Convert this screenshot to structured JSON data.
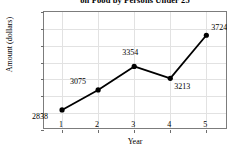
{
  "chart_data": {
    "type": "line",
    "title": "on Food by Persons Under 25",
    "xlabel": "Year",
    "ylabel": "Amount (dollars)",
    "x": [
      1,
      2,
      3,
      4,
      5
    ],
    "categories": [
      "1",
      "2",
      "3",
      "4",
      "5"
    ],
    "series": [
      {
        "name": "Amount Spent on Food",
        "values": [
          2838,
          3075,
          3354,
          3213,
          3724
        ]
      }
    ],
    "point_labels": [
      "2838",
      "3075",
      "3354",
      "3213",
      "3724"
    ],
    "ylim": [
      2600,
      4000
    ],
    "yticks": [
      2600,
      2800,
      3000,
      3200,
      3400,
      3600,
      3800,
      4000
    ],
    "ytick_labels": [
      "2600",
      "2800",
      "3000",
      "3200",
      "3400",
      "3600",
      "3800",
      "4000"
    ],
    "xlim": [
      0.5,
      5.6
    ],
    "xticks": [
      1,
      2,
      3,
      4,
      5
    ],
    "xtick_labels": [
      "1",
      "2",
      "3",
      "4",
      "5"
    ],
    "grid": true,
    "legend": false,
    "colors": {
      "line": "#000000",
      "marker": "#000000",
      "grid": "#e2e2e2",
      "frame": "#7c7c7c",
      "text": "#000000",
      "background": "#ffffff"
    },
    "marker": "circle",
    "line_width": 1.8
  }
}
